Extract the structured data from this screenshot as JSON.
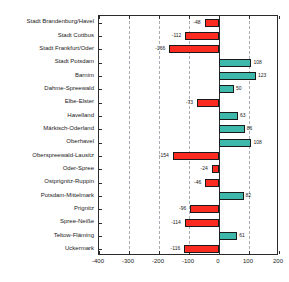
{
  "chart_data": {
    "type": "bar",
    "orientation": "horizontal",
    "title": "",
    "xlabel": "",
    "ylabel": "",
    "xlim": [
      -400,
      200
    ],
    "xticks": [
      -400,
      -300,
      -200,
      -100,
      0,
      100,
      200
    ],
    "xtick_labels": [
      "-400",
      "-300",
      "-200",
      "-100",
      "0",
      "100",
      "200"
    ],
    "grid": true,
    "grid_axis": "x",
    "legend": null,
    "colors": {
      "positive": "#3fb8ac",
      "negative": "#fc2b21",
      "edge": "#1a1a1a",
      "axis": "#2b2b2b",
      "grid": "#9aa0a6"
    },
    "categories": [
      "Stadt Brandenburg/Havel",
      "Stadt Cottbus",
      "Stadt Frankfurt/Oder",
      "Stadt Potsdam",
      "Barnim",
      "Dahme-Spreewald",
      "Elbe-Elster",
      "Havelland",
      "Märkisch-Oderland",
      "Oberhavel",
      "Oberspreewald-Lausitz",
      "Oder-Spree",
      "Ostprignitz-Ruppin",
      "Potsdam-Mittelmark",
      "Prignitz",
      "Spree-Neiße",
      "Teltow-Fläming",
      "Uckermark"
    ],
    "values": [
      -48,
      -112,
      -166,
      108,
      123,
      50,
      -73,
      63,
      86,
      108,
      -154,
      -24,
      -46,
      82,
      -96,
      -114,
      61,
      -116
    ],
    "value_labels": [
      "-48",
      "-112",
      "-166",
      "108",
      "123",
      "50",
      "-73",
      "63",
      "86",
      "108",
      "-154",
      "-24",
      "-46",
      "82",
      "-96",
      "-114",
      "61",
      "-116"
    ]
  }
}
